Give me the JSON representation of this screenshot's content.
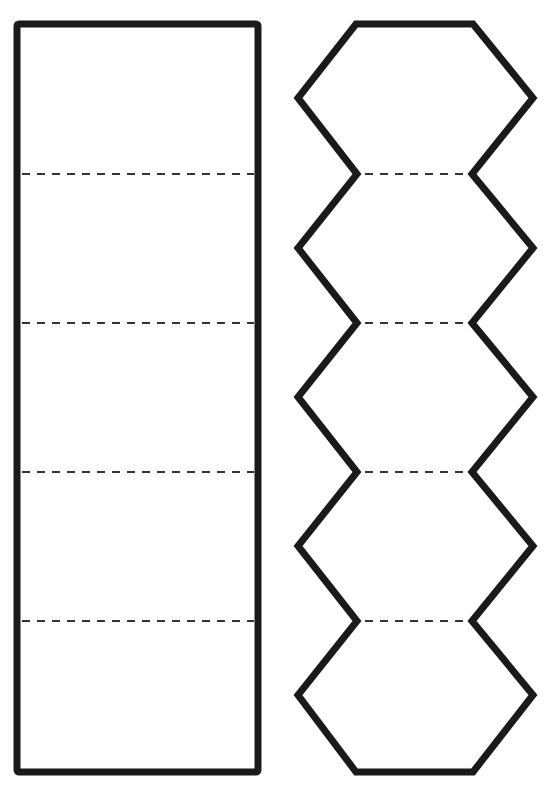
{
  "diagram": {
    "colors": {
      "background": "#ffffff",
      "stroke": "#1a1a1a",
      "fold_line": "#333333"
    },
    "rectangle_strip": {
      "panels": 5,
      "x": 17,
      "y": 24,
      "width": 241,
      "height": 748,
      "fold_lines_y": [
        174,
        323,
        472,
        621
      ]
    },
    "hexagon_chain": {
      "hexagons": 5,
      "outer_left_x": 298,
      "outer_right_x": 533,
      "inner_left_x": 357,
      "inner_right_x": 472,
      "top_y": 24,
      "bottom_y": 772,
      "top_edge": [
        356,
        473
      ],
      "outer_vertex_y": [
        98,
        248,
        397,
        546,
        695
      ],
      "fold_lines_y": [
        174,
        323,
        472,
        621
      ],
      "fold_line_x": [
        365,
        465
      ]
    }
  }
}
